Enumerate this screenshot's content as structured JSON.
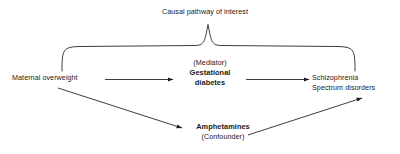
{
  "diagram": {
    "title": "Causal pathway of interest",
    "background_color": "#ffffff",
    "line_color": "#1a1a1a",
    "text_color": "#1a1a1a",
    "nodes": {
      "exposure": {
        "label": "Maternal overweight",
        "weight": "regular"
      },
      "mediator": {
        "role_label": "(Mediator)",
        "line1": "Gestational",
        "line2": "diabetes",
        "weight": "bold"
      },
      "outcome": {
        "line1": "Schizophrenia",
        "line2": "Spectrum disorders",
        "weight": "regular"
      },
      "confounder": {
        "label": "Amphetamines",
        "role_label": "(Confounder)",
        "weight": "bold"
      }
    },
    "edges": [
      {
        "name": "exposure-to-mediator",
        "from": "Maternal overweight",
        "to": "Gestational diabetes",
        "style": "straight-arrow"
      },
      {
        "name": "mediator-to-outcome",
        "from": "Gestational diabetes",
        "to": "Schizophrenia Spectrum disorders",
        "style": "straight-arrow"
      },
      {
        "name": "exposure-to-confounder",
        "from": "Maternal overweight",
        "to": "Amphetamines",
        "style": "diagonal-arrow"
      },
      {
        "name": "confounder-to-outcome",
        "from": "Amphetamines",
        "to": "Schizophrenia Spectrum disorders",
        "style": "diagonal-arrow"
      }
    ],
    "brace": {
      "name": "causal-pathway-brace",
      "spans_from": "Maternal overweight",
      "spans_to": "Schizophrenia Spectrum disorders",
      "label": "Causal pathway of interest"
    }
  }
}
